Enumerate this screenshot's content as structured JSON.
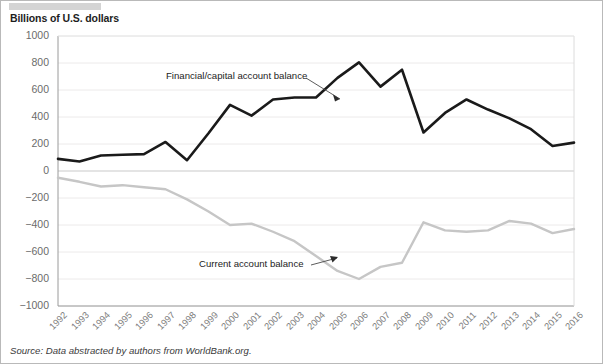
{
  "figure": {
    "axis_title": "Billions of U.S. dollars",
    "source_note": "Source: Data abstracted by authors from WorldBank.org."
  },
  "annotations": {
    "financial": "Financial/capital account balance",
    "current": "Current account balance"
  },
  "colors": {
    "financial_line": "#1a1a1a",
    "current_line": "#c6c6c6",
    "grid": "#eceaea",
    "axis": "#9a9a9a",
    "tick_text": "#6b6b6b",
    "top_bar": "#d4d4d4"
  },
  "chart_data": {
    "type": "line",
    "title": "",
    "xlabel": "",
    "ylabel": "Billions of U.S. dollars",
    "ylim": [
      -1000,
      1000
    ],
    "yticks": [
      1000,
      800,
      600,
      400,
      200,
      0,
      -200,
      -400,
      -600,
      -800,
      -1000
    ],
    "ytick_labels": [
      "1000",
      "800",
      "600",
      "400",
      "200",
      "0",
      "−200",
      "−400",
      "−600",
      "−800",
      "−1000"
    ],
    "grid": true,
    "legend": "annotated-inline",
    "categories": [
      "1992",
      "1993",
      "1994",
      "1995",
      "1996",
      "1997",
      "1998",
      "1999",
      "2000",
      "2001",
      "2002",
      "2003",
      "2004",
      "2005",
      "2006",
      "2007",
      "2008",
      "2009",
      "2010",
      "2011",
      "2012",
      "2013",
      "2014",
      "2015",
      "2016"
    ],
    "series": [
      {
        "name": "Financial/capital account balance",
        "color": "#1a1a1a",
        "values": [
          90,
          70,
          115,
          120,
          125,
          215,
          80,
          280,
          490,
          410,
          530,
          545,
          545,
          690,
          805,
          625,
          750,
          285,
          430,
          530,
          455,
          390,
          310,
          185,
          210
        ]
      },
      {
        "name": "Current account balance",
        "color": "#c6c6c6",
        "values": [
          -50,
          -80,
          -115,
          -105,
          -120,
          -135,
          -210,
          -300,
          -400,
          -390,
          -450,
          -520,
          -630,
          -740,
          -800,
          -710,
          -680,
          -380,
          -440,
          -450,
          -440,
          -370,
          -390,
          -460,
          -430
        ]
      }
    ]
  }
}
